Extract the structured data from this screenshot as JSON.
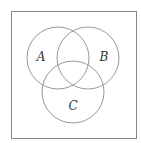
{
  "diagram": {
    "type": "venn",
    "frame": {
      "x": 11,
      "y": 11,
      "width": 125,
      "height": 127,
      "stroke": "#888888"
    },
    "circle_stroke": "#999999",
    "sets": [
      {
        "label": "A",
        "cx": 58,
        "cy": 58,
        "r": 31,
        "label_x": 41,
        "label_y": 61
      },
      {
        "label": "B",
        "cx": 88,
        "cy": 58,
        "r": 31,
        "label_x": 104,
        "label_y": 61
      },
      {
        "label": "C",
        "cx": 73,
        "cy": 92,
        "r": 31,
        "label_x": 73,
        "label_y": 110
      }
    ]
  }
}
